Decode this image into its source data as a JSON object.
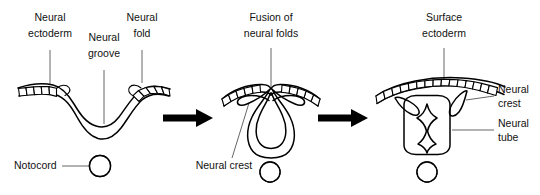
{
  "figure": {
    "background_color": "#ffffff",
    "line_color": "#000000",
    "label_color": "#111111",
    "leader_color": "#555555"
  },
  "stages": [
    {
      "id": "stage-1",
      "name": "neural-groove-stage",
      "labels": [
        {
          "id": "neural-ectoderm",
          "line1": "Neural",
          "line2": "ectoderm"
        },
        {
          "id": "neural-groove",
          "line1": "Neural",
          "line2": "groove"
        },
        {
          "id": "neural-fold",
          "line1": "Neural",
          "line2": "fold"
        },
        {
          "id": "notocord",
          "line1": "Notocord",
          "line2": ""
        }
      ],
      "notochord": {
        "present": true,
        "pattern": "diagonal-hatch"
      }
    },
    {
      "id": "stage-2",
      "name": "fusion-stage",
      "labels": [
        {
          "id": "fusion-of-neural-folds",
          "line1": "Fusion of",
          "line2": "neural folds"
        },
        {
          "id": "neural-crest",
          "line1": "Neural crest",
          "line2": ""
        }
      ],
      "notochord": {
        "present": true,
        "pattern": "diagonal-hatch"
      }
    },
    {
      "id": "stage-3",
      "name": "neural-tube-stage",
      "labels": [
        {
          "id": "surface-ectoderm",
          "line1": "Surface",
          "line2": "ectoderm"
        },
        {
          "id": "neural-crest",
          "line1": "Neural",
          "line2": "crest"
        },
        {
          "id": "neural-tube",
          "line1": "Neural",
          "line2": "tube"
        }
      ],
      "notochord": {
        "present": true,
        "pattern": "diagonal-hatch"
      }
    }
  ],
  "arrows": [
    {
      "id": "arrow-1",
      "direction": "right"
    },
    {
      "id": "arrow-2",
      "direction": "right"
    }
  ]
}
